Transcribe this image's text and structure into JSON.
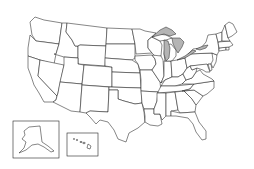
{
  "map": {
    "title": "United States outline map",
    "background": "#ffffff",
    "stroke_color": "#222222",
    "lake_color": "#b4b4b4",
    "regions": [
      "Washington",
      "Oregon",
      "California",
      "Idaho",
      "Nevada",
      "Montana",
      "Wyoming",
      "Utah",
      "Arizona",
      "Colorado",
      "New Mexico",
      "North Dakota",
      "South Dakota",
      "Nebraska",
      "Kansas",
      "Oklahoma",
      "Texas",
      "Minnesota",
      "Iowa",
      "Missouri",
      "Arkansas",
      "Louisiana",
      "Wisconsin",
      "Illinois",
      "Michigan",
      "Indiana",
      "Ohio",
      "Kentucky",
      "Tennessee",
      "Mississippi",
      "Alabama",
      "Georgia",
      "Florida",
      "South Carolina",
      "North Carolina",
      "Virginia",
      "West Virginia",
      "Pennsylvania",
      "New York",
      "Maryland",
      "Delaware",
      "New Jersey",
      "Connecticut",
      "Rhode Island",
      "Massachusetts",
      "Vermont",
      "New Hampshire",
      "Maine"
    ],
    "lakes": [
      "Lake Superior",
      "Lake Michigan",
      "Lake Huron",
      "Lake Erie",
      "Lake Ontario"
    ],
    "insets": [
      {
        "name": "Alaska"
      },
      {
        "name": "Hawaii"
      }
    ]
  }
}
